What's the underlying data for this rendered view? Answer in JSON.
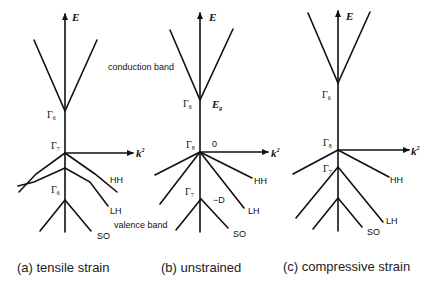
{
  "figure": {
    "energy_axis_label": "E",
    "momentum_axis_label": "k",
    "momentum_axis_superscript": "2",
    "conduction_band_label": "conduction band",
    "valence_band_label": "valence band",
    "panels": [
      {
        "id": "a",
        "caption": "(a) tensile strain",
        "conduction_point": {
          "symbol": "Γ",
          "sub": "6"
        },
        "valence_top_point": {
          "symbol": "Γ",
          "sub": "7"
        },
        "split_point": {
          "symbol": "Γ",
          "sub": "6"
        },
        "bands": {
          "hh": "HH",
          "lh": "LH",
          "so": "SO"
        }
      },
      {
        "id": "b",
        "caption": "(b) unstrained",
        "conduction_point": {
          "symbol": "Γ",
          "sub": "6"
        },
        "gap_label": "E",
        "gap_sub": "g",
        "valence_top_point": {
          "symbol": "Γ",
          "sub": "8"
        },
        "valence_top_value": "0",
        "split_point": {
          "symbol": "Γ",
          "sub": "7"
        },
        "split_value": "−D",
        "bands": {
          "hh": "HH",
          "lh": "LH",
          "so": "SO"
        }
      },
      {
        "id": "c",
        "caption": "(c) compressive strain",
        "conduction_point": {
          "symbol": "Γ",
          "sub": "6"
        },
        "valence_top_point": {
          "symbol": "Γ",
          "sub": "8"
        },
        "split_point": {
          "symbol": "Γ",
          "sub": "7"
        },
        "bands": {
          "hh": "HH",
          "lh": "LH",
          "so": "SO"
        }
      }
    ]
  }
}
